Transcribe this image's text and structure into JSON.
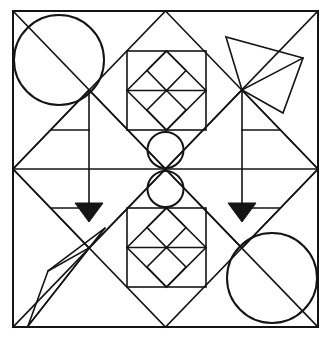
{
  "figure": {
    "canvas": {
      "width": 332,
      "height": 341,
      "background": "#ffffff"
    },
    "colors": {
      "ink": "#141414",
      "fill": "#ffffff",
      "arrow_fill": "#141414"
    },
    "frame": {
      "x1": 13,
      "y1": 11,
      "x2": 318,
      "y2": 327,
      "stroke_width": 2.0
    },
    "geometry": {
      "center": {
        "x": 165.5,
        "y": 169
      },
      "edge_midpoints": {
        "top": {
          "x": 165.5,
          "y": 11
        },
        "bottom": {
          "x": 165.5,
          "y": 327
        },
        "left": {
          "x": 13,
          "y": 169
        },
        "right": {
          "x": 318,
          "y": 169
        }
      },
      "quarter_points": {
        "top_left_q": {
          "x": 89,
          "y": 90
        },
        "top_right_q": {
          "x": 242,
          "y": 90
        },
        "bottom_left_q": {
          "x": 89,
          "y": 248
        },
        "bottom_right_q": {
          "x": 242,
          "y": 248
        }
      }
    },
    "lines": {
      "horizontal_midline": {
        "x1": 13,
        "y1": 169,
        "x2": 318,
        "y2": 169
      },
      "main_diagonals": [
        {
          "name": "tl-br",
          "x1": 13,
          "y1": 11,
          "x2": 318,
          "y2": 327
        },
        {
          "name": "tr-bl",
          "x1": 318,
          "y1": 11,
          "x2": 13,
          "y2": 327
        }
      ],
      "inner_diamond": {
        "name": "large-diamond",
        "points": "165.5,11 318,169 165.5,327 13,169"
      },
      "half_diamonds": [
        {
          "name": "upper-left-diamond",
          "points": "89,90 165.5,169 89,248 13,169"
        },
        {
          "name": "upper-right-diamond",
          "points": "242,90 318,169 242,248 165.5,169"
        }
      ]
    },
    "circles": [
      {
        "name": "circle-top-left",
        "cx": 59,
        "cy": 60,
        "r": 45
      },
      {
        "name": "circle-bottom-right",
        "cx": 272,
        "cy": 278,
        "r": 45
      },
      {
        "name": "circle-center-upper",
        "cx": 165.5,
        "cy": 150,
        "r": 18
      },
      {
        "name": "circle-center-lower",
        "cx": 165.5,
        "cy": 189,
        "r": 18
      }
    ],
    "inner_squares": [
      {
        "name": "square-top-center",
        "x": 127,
        "y": 51,
        "width": 79,
        "height": 79,
        "midline_y": 90.5,
        "has_diamond": true,
        "has_sub_diamonds": true
      },
      {
        "name": "square-bottom-center",
        "x": 127,
        "y": 208,
        "width": 79,
        "height": 79,
        "midline_y": 247.5,
        "has_diamond": true,
        "has_sub_diamonds": true
      }
    ],
    "arrows": [
      {
        "name": "arrow-left-down",
        "shaft": {
          "x": 89,
          "y1": 90,
          "y2": 203
        },
        "head": {
          "points": "75,203 103,203 89,222"
        },
        "direction": "down"
      },
      {
        "name": "arrow-right-down",
        "shaft": {
          "x": 242,
          "y1": 90,
          "y2": 203
        },
        "head": {
          "points": "228,203 256,203 242,222"
        },
        "direction": "down"
      }
    ],
    "overlay_polygons": [
      {
        "name": "quadrilateral-top-right",
        "points": "226,37 242,90 283,113 303,58",
        "note": "rotated quadrilateral in upper-right quadrant"
      },
      {
        "name": "quadrilateral-bottom-left",
        "points": "105,228 89,248 48,271 28,326",
        "note": "mirrored quadrilateral in lower-left quadrant"
      }
    ],
    "stubs": [
      {
        "name": "left-mid-stub",
        "x1": 51,
        "y1": 130,
        "x2": 89,
        "y2": 130
      },
      {
        "name": "right-mid-stub",
        "x1": 242,
        "y1": 130,
        "x2": 280,
        "y2": 130
      },
      {
        "name": "left-mid-stub-lower",
        "x1": 51,
        "y1": 208,
        "x2": 89,
        "y2": 208
      },
      {
        "name": "right-mid-stub-lower",
        "x1": 242,
        "y1": 208,
        "x2": 280,
        "y2": 208
      }
    ]
  }
}
